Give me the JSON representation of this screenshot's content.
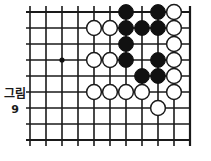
{
  "figure": {
    "caption_label": "그림",
    "caption_number": "9",
    "caption_full": "그림 9"
  },
  "board": {
    "name": "go-board",
    "cols": 11,
    "rows": 9,
    "origin_x": 30,
    "origin_y": 12,
    "spacing": 16,
    "line_color": "#1a1a1a",
    "line_width": 1.6,
    "edge_line_width": 2.2,
    "background_color": "#ffffff",
    "right_edge_col": 10,
    "bottom_edge_row": 8,
    "star_points": [
      {
        "col": 2,
        "row": 3,
        "radius": 2.6,
        "color": "#111111"
      }
    ],
    "stone_radius": 7.4,
    "black_color": "#111111",
    "white_color": "#ffffff",
    "white_stroke": "#1a1a1a",
    "stones": [
      {
        "col": 6,
        "row": 0,
        "color": "black"
      },
      {
        "col": 8,
        "row": 0,
        "color": "black"
      },
      {
        "col": 9,
        "row": 0,
        "color": "white"
      },
      {
        "col": 4,
        "row": 1,
        "color": "white"
      },
      {
        "col": 5,
        "row": 1,
        "color": "white"
      },
      {
        "col": 6,
        "row": 1,
        "color": "black"
      },
      {
        "col": 7,
        "row": 1,
        "color": "black"
      },
      {
        "col": 8,
        "row": 1,
        "color": "black"
      },
      {
        "col": 9,
        "row": 1,
        "color": "white"
      },
      {
        "col": 6,
        "row": 2,
        "color": "black"
      },
      {
        "col": 9,
        "row": 2,
        "color": "white"
      },
      {
        "col": 4,
        "row": 3,
        "color": "white"
      },
      {
        "col": 5,
        "row": 3,
        "color": "white"
      },
      {
        "col": 6,
        "row": 3,
        "color": "black"
      },
      {
        "col": 8,
        "row": 3,
        "color": "black"
      },
      {
        "col": 9,
        "row": 3,
        "color": "white"
      },
      {
        "col": 7,
        "row": 4,
        "color": "black"
      },
      {
        "col": 8,
        "row": 4,
        "color": "black"
      },
      {
        "col": 9,
        "row": 4,
        "color": "white"
      },
      {
        "col": 4,
        "row": 5,
        "color": "white"
      },
      {
        "col": 5,
        "row": 5,
        "color": "white"
      },
      {
        "col": 6,
        "row": 5,
        "color": "white"
      },
      {
        "col": 7,
        "row": 5,
        "color": "white"
      },
      {
        "col": 9,
        "row": 5,
        "color": "white"
      },
      {
        "col": 8,
        "row": 6,
        "color": "white"
      }
    ]
  }
}
